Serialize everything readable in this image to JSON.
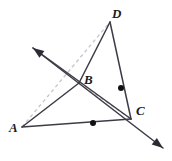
{
  "figure": {
    "type": "geometry-diagram",
    "width": 172,
    "height": 161,
    "background_color": "#ffffff",
    "stroke_color": "#3c3c46",
    "dashed_color": "#c8c8cd",
    "point_fill": "#111111",
    "labels": {
      "a": "A",
      "b": "B",
      "c": "C",
      "d": "D"
    },
    "points": {
      "A": {
        "x": 22,
        "y": 127,
        "label": "A"
      },
      "B": {
        "x": 79,
        "y": 83,
        "label": "B"
      },
      "C": {
        "x": 131,
        "y": 119,
        "label": "C"
      },
      "D": {
        "x": 110,
        "y": 22,
        "label": "D"
      }
    },
    "midpoint_marks": [
      {
        "name": "midpoint-AC",
        "x": 93,
        "y": 123,
        "radius": 3
      },
      {
        "name": "midpoint-DC",
        "x": 121,
        "y": 88,
        "radius": 3
      }
    ],
    "solid_segments": [
      {
        "name": "segment-AC",
        "x1": 22,
        "y1": 127,
        "x2": 131,
        "y2": 119
      },
      {
        "name": "segment-CD",
        "x1": 131,
        "y1": 119,
        "x2": 110,
        "y2": 22
      },
      {
        "name": "segment-DB",
        "x1": 110,
        "y1": 22,
        "x2": 79,
        "y2": 83
      },
      {
        "name": "segment-BA",
        "x1": 79,
        "y1": 83,
        "x2": 22,
        "y2": 127
      }
    ],
    "dashed_segments": [
      {
        "name": "dashed-AD",
        "x1": 22,
        "y1": 127,
        "x2": 110,
        "y2": 22
      },
      {
        "name": "dashed-BC",
        "x1": 79,
        "y1": 83,
        "x2": 131,
        "y2": 119
      }
    ],
    "rays": [
      {
        "name": "ray-through-B-to-lower-right",
        "x1": 33,
        "y1": 48,
        "x2": 163,
        "y2": 148,
        "arrow_at": "end"
      },
      {
        "name": "ray-through-B-to-upper-left",
        "x1": 131,
        "y1": 119,
        "x2": 33,
        "y2": 48,
        "arrow_at": "end"
      }
    ],
    "arrowheads": [
      {
        "name": "arrowhead-upper-left",
        "tip_x": 33,
        "tip_y": 48
      },
      {
        "name": "arrowhead-lower-right",
        "tip_x": 163,
        "tip_y": 148
      }
    ]
  }
}
